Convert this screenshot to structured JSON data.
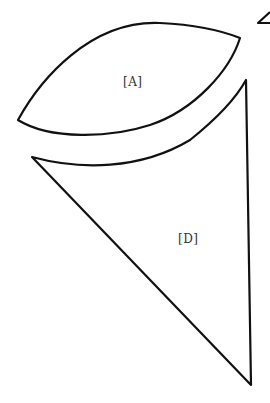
{
  "diagram": {
    "stroke_color": "#111111",
    "background": "#ffffff",
    "pieces": [
      {
        "id": "A",
        "label": "[A]",
        "shape": "lens",
        "label_pos": [
          123,
          70
        ]
      },
      {
        "id": "D",
        "label": "[D]",
        "shape": "triangle",
        "label_pos": [
          179,
          236
        ]
      },
      {
        "id": "partial",
        "label": "",
        "shape": "triangle-fragment-top-right"
      }
    ]
  }
}
